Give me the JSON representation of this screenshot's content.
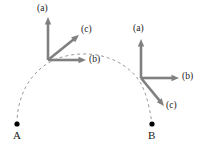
{
  "figure": {
    "background_color": "#ffffff",
    "arrow_color": "#808080",
    "curve_color": "#9a9a9a",
    "point_color": "#000000",
    "text_color": "#1a1a1a",
    "width": 202,
    "height": 147
  },
  "points": [
    {
      "id": "A",
      "label": "A",
      "x": 17,
      "y": 124,
      "label_x": 13,
      "label_y": 130
    },
    {
      "id": "B",
      "label": "B",
      "x": 152,
      "y": 124,
      "label_x": 148,
      "label_y": 130
    }
  ],
  "curve": {
    "name": "dashed-path",
    "style": "dashed",
    "from": "A",
    "to": "B",
    "dash_pattern": "3,3",
    "stroke_width": 1,
    "path": "M 17 124 C 17 88, 38 62, 66 56 C 96 49, 126 60, 140 82 C 147 94, 150 110, 152 124"
  },
  "frames": [
    {
      "id": "frame-left",
      "name": "triad-at-A-transported",
      "origin_x": 48,
      "origin_y": 60,
      "axes": [
        {
          "id": "left-a",
          "label": "(a)",
          "tip_x": 48,
          "tip_y": 17,
          "label_x": 37,
          "label_y": 4,
          "direction": "up"
        },
        {
          "id": "left-b",
          "label": "(b)",
          "tip_x": 86,
          "tip_y": 60,
          "label_x": 89,
          "label_y": 55,
          "direction": "right"
        },
        {
          "id": "left-c",
          "label": "(c)",
          "tip_x": 79,
          "tip_y": 35,
          "label_x": 81,
          "label_y": 25,
          "direction": "up-right"
        }
      ]
    },
    {
      "id": "frame-right",
      "name": "triad-at-B",
      "origin_x": 141,
      "origin_y": 78,
      "axes": [
        {
          "id": "right-a",
          "label": "(a)",
          "tip_x": 141,
          "tip_y": 39,
          "label_x": 133,
          "label_y": 24,
          "direction": "up"
        },
        {
          "id": "right-b",
          "label": "(b)",
          "tip_x": 179,
          "tip_y": 78,
          "label_x": 182,
          "label_y": 72,
          "direction": "right"
        },
        {
          "id": "right-c",
          "label": "(c)",
          "tip_x": 164,
          "tip_y": 106,
          "label_x": 166,
          "label_y": 101,
          "direction": "down-right"
        }
      ]
    }
  ]
}
